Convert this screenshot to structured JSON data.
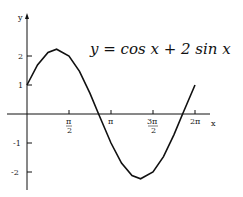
{
  "chart_data": {
    "type": "line",
    "title": "y = cos x + 2 sin x",
    "xlabel": "x",
    "ylabel": "y",
    "xlim": [
      0,
      6.2832
    ],
    "ylim": [
      -2.6,
      2.9
    ],
    "grid": false,
    "legend": null,
    "x_ticks": [
      {
        "value": 1.5708,
        "label": "π/2"
      },
      {
        "value": 3.1416,
        "label": "π"
      },
      {
        "value": 4.7124,
        "label": "3π/2"
      },
      {
        "value": 6.2832,
        "label": "2π"
      }
    ],
    "y_ticks": [
      {
        "value": 2,
        "label": "2"
      },
      {
        "value": 1,
        "label": "1"
      },
      {
        "value": -1,
        "label": "-1"
      },
      {
        "value": -2,
        "label": "-2"
      }
    ],
    "series": [
      {
        "name": "y = cos x + 2 sin x",
        "x": [
          0,
          0.3927,
          0.7854,
          1.1071,
          1.5708,
          1.9635,
          2.3562,
          2.6779,
          3.1416,
          3.5343,
          3.927,
          4.2487,
          4.7124,
          5.1051,
          5.4978,
          5.8195,
          6.2832
        ],
        "values": [
          1.0,
          1.69,
          2.12,
          2.236,
          2.0,
          1.47,
          0.71,
          0.0,
          -1.0,
          -1.69,
          -2.12,
          -2.236,
          -2.0,
          -1.47,
          -0.71,
          0.0,
          1.0
        ]
      }
    ]
  },
  "labels": {
    "equation": "y = cos x + 2 sin x",
    "y_axis": "y",
    "x_axis": "x",
    "x_tick_pi_half": "π",
    "x_tick_pi_half_den": "2",
    "x_tick_pi": "π",
    "x_tick_3pi_half": "3π",
    "x_tick_3pi_half_den": "2",
    "x_tick_2pi": "2π",
    "y_tick_2": "2",
    "y_tick_1": "1",
    "y_tick_m1": "-1",
    "y_tick_m2": "-2"
  }
}
